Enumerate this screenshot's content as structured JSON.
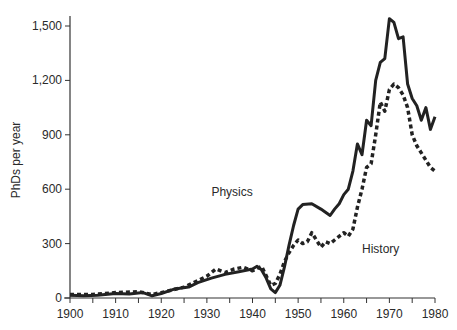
{
  "chart_data": {
    "type": "line",
    "title": "",
    "xlabel": "",
    "ylabel": "PhDs per year",
    "xlim": [
      1900,
      1980
    ],
    "ylim": [
      0,
      1600
    ],
    "grid": false,
    "legend": "inline labels",
    "x_ticks": [
      "1900",
      "1910",
      "1920",
      "1930",
      "1940",
      "1950",
      "1960",
      "1970",
      "1980"
    ],
    "y_ticks": [
      "0",
      "300",
      "600",
      "900",
      "1,200",
      "1,500"
    ],
    "series": [
      {
        "name": "Physics",
        "style": "solid",
        "label_pos": {
          "year": 1931,
          "value": 560
        },
        "points": [
          [
            1900,
            15
          ],
          [
            1903,
            12
          ],
          [
            1906,
            15
          ],
          [
            1910,
            25
          ],
          [
            1913,
            22
          ],
          [
            1916,
            30
          ],
          [
            1918,
            12
          ],
          [
            1920,
            25
          ],
          [
            1923,
            50
          ],
          [
            1926,
            60
          ],
          [
            1928,
            85
          ],
          [
            1931,
            110
          ],
          [
            1934,
            130
          ],
          [
            1937,
            145
          ],
          [
            1940,
            160
          ],
          [
            1941,
            175
          ],
          [
            1942,
            155
          ],
          [
            1943,
            110
          ],
          [
            1944,
            50
          ],
          [
            1945,
            30
          ],
          [
            1946,
            70
          ],
          [
            1947,
            170
          ],
          [
            1948,
            290
          ],
          [
            1949,
            400
          ],
          [
            1950,
            490
          ],
          [
            1951,
            515
          ],
          [
            1953,
            520
          ],
          [
            1955,
            490
          ],
          [
            1957,
            455
          ],
          [
            1958,
            490
          ],
          [
            1959,
            520
          ],
          [
            1960,
            570
          ],
          [
            1961,
            600
          ],
          [
            1962,
            700
          ],
          [
            1963,
            850
          ],
          [
            1964,
            790
          ],
          [
            1965,
            980
          ],
          [
            1966,
            950
          ],
          [
            1967,
            1200
          ],
          [
            1968,
            1300
          ],
          [
            1969,
            1320
          ],
          [
            1970,
            1540
          ],
          [
            1971,
            1520
          ],
          [
            1972,
            1430
          ],
          [
            1973,
            1440
          ],
          [
            1974,
            1180
          ],
          [
            1975,
            1100
          ],
          [
            1976,
            1060
          ],
          [
            1977,
            980
          ],
          [
            1978,
            1050
          ],
          [
            1979,
            930
          ],
          [
            1980,
            1000
          ]
        ]
      },
      {
        "name": "History",
        "style": "dashed",
        "label_pos": {
          "year": 1964,
          "value": 250
        },
        "points": [
          [
            1900,
            20
          ],
          [
            1905,
            20
          ],
          [
            1910,
            30
          ],
          [
            1915,
            35
          ],
          [
            1918,
            20
          ],
          [
            1920,
            30
          ],
          [
            1925,
            60
          ],
          [
            1930,
            120
          ],
          [
            1932,
            160
          ],
          [
            1934,
            140
          ],
          [
            1936,
            160
          ],
          [
            1938,
            170
          ],
          [
            1940,
            150
          ],
          [
            1942,
            175
          ],
          [
            1944,
            70
          ],
          [
            1945,
            80
          ],
          [
            1946,
            130
          ],
          [
            1947,
            200
          ],
          [
            1948,
            250
          ],
          [
            1949,
            290
          ],
          [
            1950,
            320
          ],
          [
            1951,
            300
          ],
          [
            1952,
            310
          ],
          [
            1953,
            360
          ],
          [
            1954,
            320
          ],
          [
            1955,
            280
          ],
          [
            1956,
            310
          ],
          [
            1957,
            300
          ],
          [
            1958,
            320
          ],
          [
            1959,
            340
          ],
          [
            1960,
            360
          ],
          [
            1961,
            340
          ],
          [
            1962,
            380
          ],
          [
            1963,
            500
          ],
          [
            1964,
            600
          ],
          [
            1965,
            720
          ],
          [
            1966,
            740
          ],
          [
            1967,
            900
          ],
          [
            1968,
            1080
          ],
          [
            1969,
            1030
          ],
          [
            1970,
            1150
          ],
          [
            1971,
            1180
          ],
          [
            1972,
            1160
          ],
          [
            1973,
            1120
          ],
          [
            1974,
            1050
          ],
          [
            1975,
            900
          ],
          [
            1976,
            840
          ],
          [
            1977,
            800
          ],
          [
            1978,
            760
          ],
          [
            1979,
            720
          ],
          [
            1980,
            700
          ]
        ]
      }
    ]
  }
}
